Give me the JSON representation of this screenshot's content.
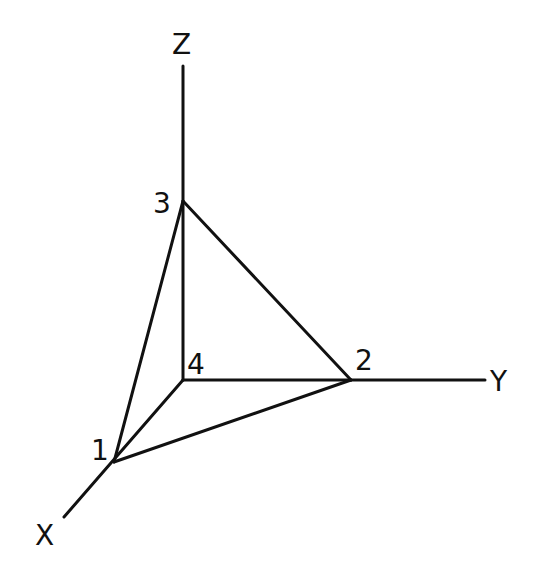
{
  "diagram": {
    "type": "3d-axes-tetrahedron",
    "axes": {
      "x": {
        "label": "X"
      },
      "y": {
        "label": "Y"
      },
      "z": {
        "label": "Z"
      }
    },
    "vertices": [
      {
        "id": "1",
        "label": "1",
        "position": "on X axis"
      },
      {
        "id": "2",
        "label": "2",
        "position": "on Y axis"
      },
      {
        "id": "3",
        "label": "3",
        "position": "on Z axis"
      },
      {
        "id": "4",
        "label": "4",
        "position": "origin"
      }
    ],
    "edges": [
      [
        "1",
        "2"
      ],
      [
        "1",
        "3"
      ],
      [
        "2",
        "3"
      ],
      [
        "1",
        "4"
      ],
      [
        "2",
        "4"
      ],
      [
        "3",
        "4"
      ]
    ],
    "line_color": "#111111"
  }
}
